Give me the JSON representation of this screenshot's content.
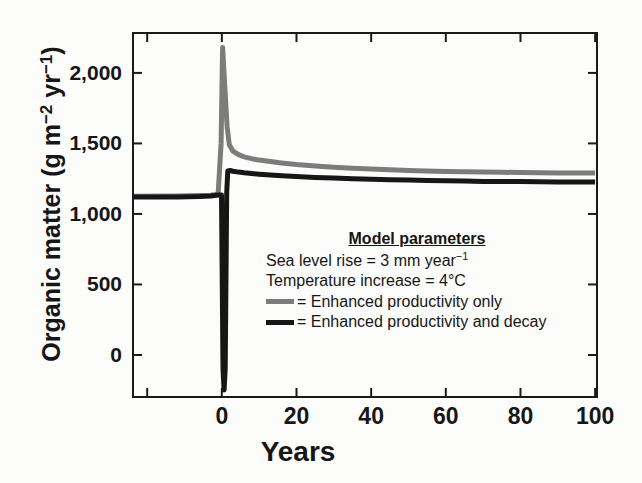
{
  "figure": {
    "background": "#fcfcfb",
    "axis_color": "#1a1a1a",
    "text_color": "#161616"
  },
  "legend": {
    "title": "Model parameters",
    "param1_segments": [
      {
        "t": "Sea level rise = 3 mm year"
      },
      {
        "t": "−1",
        "sup": true
      }
    ],
    "param2": "Temperature increase = 4°C",
    "entries": [
      {
        "label": "= Enhanced productivity only",
        "color": "#7c7c7c"
      },
      {
        "label": "= Enhanced productivity and decay",
        "color": "#161616"
      }
    ]
  },
  "chart_data": {
    "type": "line",
    "title": "",
    "xlabel": "Years",
    "ylabel": "Organic matter (g m−2 yr−1)",
    "ylabel_segments": [
      {
        "t": "Organic matter (g m"
      },
      {
        "t": "−2",
        "sup": true
      },
      {
        "t": " yr"
      },
      {
        "t": "−1",
        "sup": true
      },
      {
        "t": ")"
      }
    ],
    "xlim": [
      -23.8,
      100.5
    ],
    "ylim": [
      -298,
      2283
    ],
    "grid": false,
    "legend_position": "inside-middle-right",
    "x_ticks": [
      0,
      20,
      40,
      60,
      80,
      100
    ],
    "x_tick_labels": [
      "0",
      "20",
      "40",
      "60",
      "80",
      "100"
    ],
    "x_unlabeled_ticks": [
      -20
    ],
    "y_ticks": [
      0,
      500,
      1000,
      1500,
      2000
    ],
    "y_tick_labels": [
      "0",
      "500",
      "1,000",
      "1,500",
      "2,000"
    ],
    "series": [
      {
        "name": "Enhanced productivity only",
        "color": "#7c7c7c",
        "width": 5,
        "points": [
          [
            -23.8,
            1125
          ],
          [
            -12,
            1127
          ],
          [
            -6,
            1130
          ],
          [
            -3,
            1133
          ],
          [
            -1,
            1140
          ],
          [
            -0.2,
            1500
          ],
          [
            0.2,
            2180
          ],
          [
            0.8,
            1900
          ],
          [
            1.4,
            1620
          ],
          [
            2,
            1490
          ],
          [
            3,
            1445
          ],
          [
            4.5,
            1420
          ],
          [
            6,
            1405
          ],
          [
            8,
            1392
          ],
          [
            10,
            1382
          ],
          [
            13,
            1371
          ],
          [
            16,
            1361
          ],
          [
            20,
            1350
          ],
          [
            25,
            1340
          ],
          [
            30,
            1331
          ],
          [
            35,
            1324
          ],
          [
            40,
            1318
          ],
          [
            45,
            1313
          ],
          [
            50,
            1308
          ],
          [
            55,
            1305
          ],
          [
            60,
            1302
          ],
          [
            65,
            1299
          ],
          [
            70,
            1297
          ],
          [
            75,
            1295
          ],
          [
            80,
            1294
          ],
          [
            85,
            1292
          ],
          [
            90,
            1291
          ],
          [
            95,
            1291
          ],
          [
            100,
            1290
          ]
        ]
      },
      {
        "name": "Enhanced productivity and decay",
        "color": "#161616",
        "width": 5,
        "points": [
          [
            -23.8,
            1120
          ],
          [
            -12,
            1121
          ],
          [
            -6,
            1124
          ],
          [
            -3,
            1128
          ],
          [
            -1,
            1135
          ],
          [
            -0.1,
            1135
          ],
          [
            0.3,
            -100
          ],
          [
            0.6,
            -248
          ],
          [
            0.9,
            -100
          ],
          [
            1.3,
            1150
          ],
          [
            1.6,
            1305
          ],
          [
            2.2,
            1308
          ],
          [
            3,
            1303
          ],
          [
            4.5,
            1297
          ],
          [
            6,
            1292
          ],
          [
            8,
            1287
          ],
          [
            10,
            1282
          ],
          [
            13,
            1276
          ],
          [
            16,
            1271
          ],
          [
            20,
            1265
          ],
          [
            25,
            1259
          ],
          [
            30,
            1254
          ],
          [
            35,
            1250
          ],
          [
            40,
            1246
          ],
          [
            45,
            1243
          ],
          [
            50,
            1240
          ],
          [
            55,
            1237
          ],
          [
            60,
            1235
          ],
          [
            65,
            1233
          ],
          [
            70,
            1231
          ],
          [
            75,
            1230
          ],
          [
            80,
            1229
          ],
          [
            85,
            1228
          ],
          [
            90,
            1227
          ],
          [
            95,
            1226
          ],
          [
            100,
            1226
          ]
        ]
      }
    ]
  }
}
